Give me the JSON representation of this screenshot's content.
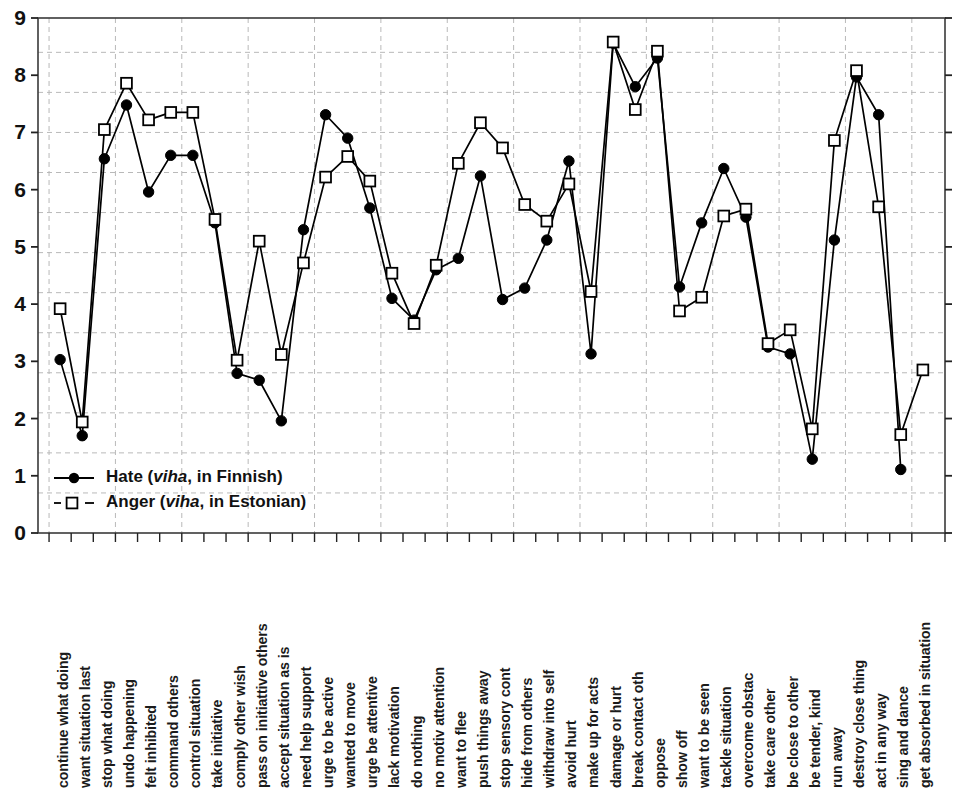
{
  "chart_data": {
    "type": "line",
    "title": "",
    "xlabel": "",
    "ylabel": "",
    "ylim": [
      0,
      9
    ],
    "yticks": [
      0,
      1,
      2,
      3,
      4,
      5,
      6,
      7,
      8,
      9
    ],
    "grid": true,
    "grid_orientation": "both",
    "grid_style": "dashed",
    "legend_position": "lower-left-inside",
    "categories": [
      "continue what doing",
      "want situation last",
      "stop what doing",
      "undo happening",
      "felt inhibited",
      "command others",
      "control situation",
      "take initiative",
      "comply other wish",
      "pass on initiattive others",
      "accept situation as is",
      "need help support",
      "urge to be active",
      "wanted to move",
      "urge be attentive",
      "lack motivation",
      "do nothing",
      "no motiv attention",
      "want to flee",
      "push things away",
      "stop sensory cont",
      "hide from others",
      "withdraw into self",
      "avoid hurt",
      "make up for acts",
      "damage or hurt",
      "break contact oth",
      "oppose",
      "show off",
      "want to be seen",
      "tackle situation",
      "overcome obstac",
      "take care other",
      "be close to other",
      "be tender, kind",
      "run away",
      "destroy close thing",
      "act in any way",
      "sing and dance",
      "get absorbed in situation"
    ],
    "series": [
      {
        "name": "Hate (viha, in Finnish)",
        "marker": "filled-circle",
        "line": "solid",
        "color": "#000000",
        "values": [
          3.03,
          1.7,
          6.54,
          7.48,
          5.96,
          6.6,
          6.6,
          5.42,
          2.79,
          2.67,
          1.96,
          5.3,
          7.31,
          6.9,
          5.68,
          4.1,
          3.72,
          4.6,
          4.8,
          6.24,
          4.08,
          4.28,
          5.12,
          6.5,
          3.13,
          8.56,
          7.8,
          8.3,
          4.3,
          5.42,
          6.37,
          5.52,
          3.25,
          3.13,
          1.29,
          5.12,
          7.97,
          7.31,
          1.11,
          null
        ]
      },
      {
        "name": "Anger (viha, in Estonian)",
        "marker": "open-square",
        "line": "dashed",
        "color": "#000000",
        "values": [
          3.92,
          1.94,
          7.05,
          7.86,
          7.22,
          7.35,
          7.35,
          5.48,
          3.02,
          5.1,
          3.12,
          4.72,
          6.22,
          6.58,
          6.15,
          4.54,
          3.66,
          4.68,
          6.46,
          7.17,
          6.73,
          5.74,
          5.45,
          6.1,
          4.22,
          8.58,
          7.4,
          8.42,
          3.88,
          4.12,
          5.54,
          5.66,
          3.31,
          3.55,
          1.82,
          6.86,
          8.08,
          5.7,
          1.72,
          2.85
        ]
      }
    ]
  },
  "legend": {
    "entries": [
      {
        "label_prefix": "Hate (",
        "label_italic": "viha",
        "label_suffix": ", in Finnish)",
        "marker": "filled-circle"
      },
      {
        "label_prefix": "Anger (",
        "label_italic": "viha",
        "label_suffix": ", in Estonian)",
        "marker": "open-square"
      }
    ]
  },
  "axes": {
    "y_tick_labels": [
      "9",
      "8",
      "7",
      "6",
      "5",
      "4",
      "3",
      "2",
      "1",
      "0"
    ]
  }
}
